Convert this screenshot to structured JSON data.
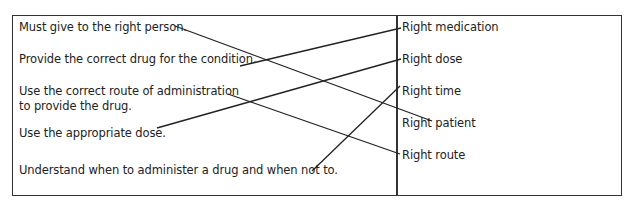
{
  "diagram": {
    "type": "matching-exercise",
    "left_items": [
      {
        "id": "l1",
        "text": "Must give to the right person."
      },
      {
        "id": "l2",
        "text": "Provide the correct drug for the condition."
      },
      {
        "id": "l3",
        "text": "Use the correct route of administration",
        "text_line2": "to provide the drug."
      },
      {
        "id": "l4",
        "text": "Use the appropriate dose."
      },
      {
        "id": "l5",
        "text": "Understand when to administer a drug and when not to."
      }
    ],
    "right_items": [
      {
        "id": "r1",
        "text": "Right medication"
      },
      {
        "id": "r2",
        "text": "Right dose"
      },
      {
        "id": "r3",
        "text": "Right time"
      },
      {
        "id": "r4",
        "text": "Right patient"
      },
      {
        "id": "r5",
        "text": "Right route"
      }
    ],
    "connections": [
      {
        "from": "l1",
        "to": "r4",
        "x1": 175,
        "y1": 26,
        "x2": 432,
        "y2": 121
      },
      {
        "from": "l2",
        "to": "r1",
        "x1": 240,
        "y1": 66,
        "x2": 401,
        "y2": 28
      },
      {
        "from": "l3",
        "to": "r5",
        "x1": 228,
        "y1": 94,
        "x2": 400,
        "y2": 154
      },
      {
        "from": "l4",
        "to": "r2",
        "x1": 157,
        "y1": 128,
        "x2": 401,
        "y2": 59
      },
      {
        "from": "l5",
        "to": "r3",
        "x1": 312,
        "y1": 171,
        "x2": 400,
        "y2": 86
      }
    ],
    "line_color": "#222222",
    "border_color": "#333333"
  }
}
